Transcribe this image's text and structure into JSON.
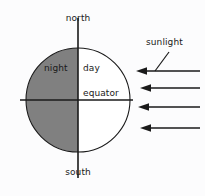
{
  "diagram": {
    "background_color": "#fcfcfd",
    "stroke_color": "#1a1a1a",
    "night_fill_color": "#808080",
    "day_fill_color": "#ffffff",
    "labels": {
      "north": "north",
      "south": "south",
      "night": "night",
      "day": "day",
      "equator": "equator",
      "sunlight": "sunlight"
    },
    "earth": {
      "center_x": 78,
      "center_y": 100,
      "radius": 52
    },
    "axis": {
      "orientation": "vertical",
      "top_y": 18,
      "bottom_y": 178
    },
    "equator_line": {
      "orientation": "horizontal",
      "left_x": 20,
      "right_x": 133,
      "y": 100
    },
    "sunlight_rays": {
      "count": 4,
      "direction": "left",
      "y_positions": [
        71,
        88,
        107,
        128
      ],
      "start_x": 200,
      "end_x": 137
    },
    "leader_line": {
      "from_x": 168,
      "from_y": 52,
      "to_x": 155,
      "to_y": 71
    }
  }
}
